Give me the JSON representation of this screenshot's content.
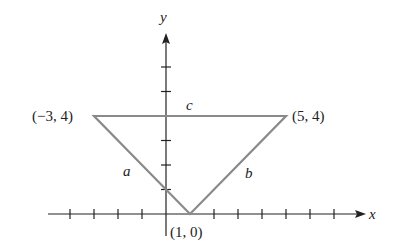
{
  "figure": {
    "type": "coordinate-triangle",
    "axes": {
      "x_label": "x",
      "y_label": "y",
      "x_ticks": [
        -4,
        -3,
        -2,
        -1,
        1,
        2,
        3,
        4,
        5,
        6,
        7
      ],
      "y_ticks": [
        1,
        2,
        3,
        4,
        5,
        6
      ]
    },
    "vertices": [
      {
        "label": "(−3, 4)",
        "x": -3,
        "y": 4
      },
      {
        "label": "(5, 4)",
        "x": 5,
        "y": 4
      },
      {
        "label": "(1, 0)",
        "x": 1,
        "y": 0
      }
    ],
    "sides": {
      "a": "a",
      "b": "b",
      "c": "c"
    },
    "colors": {
      "triangle": "#8a8a8a",
      "axes": "#222222"
    }
  }
}
